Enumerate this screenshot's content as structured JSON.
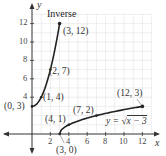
{
  "chart_data": {
    "type": "line",
    "title": "Inverse",
    "xlabel": "x",
    "ylabel": "y",
    "xlim": [
      0,
      12
    ],
    "ylim": [
      0,
      12
    ],
    "x_ticks": [
      2,
      4,
      6,
      8,
      10,
      12
    ],
    "y_ticks": [
      4,
      6,
      8,
      10,
      12
    ],
    "grid": true,
    "series": [
      {
        "name": "Inverse",
        "formula": "x = sqrt(y - 3), i.e. y = x^2 + 3, x >= 0",
        "points": [
          [
            0,
            3
          ],
          [
            1,
            4
          ],
          [
            2,
            7
          ],
          [
            3,
            12
          ]
        ],
        "color": "#222222"
      },
      {
        "name": "y = √(x − 3)",
        "formula": "y = sqrt(x - 3)",
        "points": [
          [
            3,
            0
          ],
          [
            4,
            1
          ],
          [
            7,
            2
          ],
          [
            12,
            3
          ]
        ],
        "color": "#222222"
      }
    ],
    "annotations": [
      {
        "text": "(0, 3)",
        "x": 0,
        "y": 3
      },
      {
        "text": "(1, 4)",
        "x": 1,
        "y": 4
      },
      {
        "text": "(2, 7)",
        "x": 2,
        "y": 7
      },
      {
        "text": "(3, 12)",
        "x": 3,
        "y": 12
      },
      {
        "text": "(3, 0)",
        "x": 3,
        "y": 0
      },
      {
        "text": "(4, 1)",
        "x": 4,
        "y": 1
      },
      {
        "text": "(7, 2)",
        "x": 7,
        "y": 2
      },
      {
        "text": "(12, 3)",
        "x": 12,
        "y": 3
      }
    ]
  },
  "labels": {
    "title": "Inverse",
    "y_axis": "y",
    "x_axis": "x",
    "equation_prefix": "y = ",
    "equation_radicand": "x − 3",
    "pt_0_3": "(0, 3)",
    "pt_1_4": "(1, 4)",
    "pt_2_7": "(2, 7)",
    "pt_3_12": "(3, 12)",
    "pt_3_0": "(3, 0)",
    "pt_4_1": "(4, 1)",
    "pt_7_2": "(7, 2)",
    "pt_12_3": "(12, 3)",
    "tick_x_2": "2",
    "tick_x_4": "4",
    "tick_x_6": "6",
    "tick_x_8": "8",
    "tick_x_10": "10",
    "tick_x_12": "12",
    "tick_y_4": "4",
    "tick_y_6": "6",
    "tick_y_8": "8",
    "tick_y_10": "10",
    "tick_y_12": "12"
  }
}
